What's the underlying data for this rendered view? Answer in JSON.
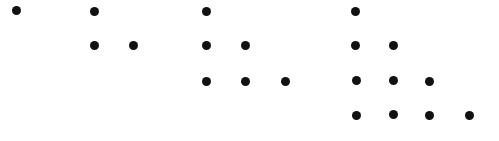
{
  "diagram": {
    "title": "",
    "dot_color": "#111111",
    "background": "#ffffff",
    "dot_diameter": 9,
    "groups": [
      {
        "name": "triangle-1",
        "count": 1,
        "dots": [
          [
            16,
            10
          ]
        ]
      },
      {
        "name": "triangle-3",
        "count": 3,
        "dots": [
          [
            94,
            11
          ],
          [
            94,
            45
          ],
          [
            133,
            45
          ]
        ]
      },
      {
        "name": "triangle-6",
        "count": 6,
        "dots": [
          [
            206,
            11
          ],
          [
            206,
            45
          ],
          [
            245,
            45
          ],
          [
            206,
            81
          ],
          [
            245,
            81
          ],
          [
            285,
            81
          ]
        ]
      },
      {
        "name": "triangle-10",
        "count": 10,
        "dots": [
          [
            355,
            11
          ],
          [
            355,
            45
          ],
          [
            393,
            45
          ],
          [
            356,
            80
          ],
          [
            393,
            80
          ],
          [
            429,
            81
          ],
          [
            356,
            115
          ],
          [
            393,
            114
          ],
          [
            429,
            115
          ],
          [
            469,
            115
          ]
        ]
      }
    ]
  }
}
